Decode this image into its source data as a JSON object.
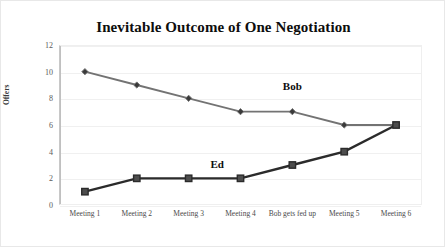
{
  "chart_data": {
    "type": "line",
    "title": "Inevitable Outcome of One Negotiation",
    "xlabel": "",
    "ylabel": "Offers",
    "categories": [
      "Meeting 1",
      "Meeting 2",
      "Meeting 3",
      "Meeting 4",
      "Bob gets fed up",
      "Meeting 5",
      "Meeting 6"
    ],
    "ylim": [
      0,
      12
    ],
    "yticks": [
      0,
      2,
      4,
      6,
      8,
      10,
      12
    ],
    "grid": true,
    "legend_position": "inline-annotation",
    "series": [
      {
        "name": "Bob",
        "values": [
          10,
          9,
          8,
          7,
          7,
          6,
          6
        ],
        "color": "#737373",
        "marker": "diamond",
        "label_x_category_index": 4,
        "label_value": 8.9
      },
      {
        "name": "Ed",
        "values": [
          1,
          2,
          2,
          2,
          3,
          4,
          6
        ],
        "color": "#2b2b2b",
        "marker": "square",
        "label_x_category_index": 2.55,
        "label_value": 3.1
      }
    ]
  },
  "colors": {
    "background": "#ffffff",
    "gridline": "#f0f0f0",
    "axis": "#c0c0c0",
    "title_text": "#0d0d0d",
    "tick_text": "#4a4a4a",
    "bob_series": "#737373",
    "ed_series": "#2b2b2b"
  }
}
